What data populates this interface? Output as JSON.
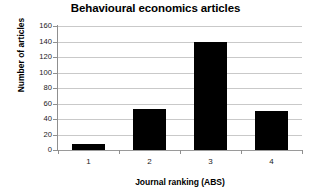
{
  "chart_data": {
    "type": "bar",
    "title": "Behavioural economics articles",
    "xlabel": "Journal ranking (ABS)",
    "ylabel": "Number of articles",
    "categories": [
      "1",
      "2",
      "3",
      "4"
    ],
    "values": [
      8,
      53,
      140,
      50
    ],
    "ylim": [
      0,
      160
    ],
    "yticks": [
      0,
      20,
      40,
      60,
      80,
      100,
      120,
      140,
      160
    ],
    "ytick_labels": [
      "0",
      "20",
      "40",
      "60",
      "80",
      "100",
      "120",
      "140",
      "160"
    ],
    "grid": "horizontal",
    "legend": "none",
    "bar_color": "#000000",
    "gridline_color": "#c9c9c9",
    "axis_color": "#8f8f8f",
    "background_color": "#ffffff",
    "series": [
      {
        "name": "Number of articles",
        "values": [
          8,
          53,
          140,
          50
        ]
      }
    ]
  }
}
